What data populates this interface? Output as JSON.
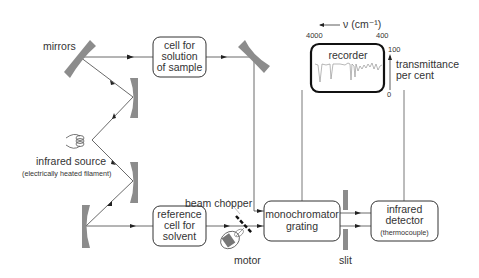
{
  "diagram": {
    "labels": {
      "mirrors": "mirrors",
      "source": "infrared source",
      "source_sub": "(electrically heated filament)",
      "beam_chopper": "beam chopper",
      "motor": "motor",
      "slit": "slit",
      "wavenumber_axis": "ν (cm⁻¹)",
      "wn_left": "4000",
      "wn_right": "400",
      "t_top": "100",
      "t_bottom": "0",
      "transmittance_1": "transmittance",
      "transmittance_2": "per cent"
    },
    "boxes": {
      "sample_cell": [
        "cell for",
        "solution",
        "of sample"
      ],
      "reference_cell": [
        "reference",
        "cell for",
        "solvent"
      ],
      "monochromator": [
        "monochromator",
        "grating"
      ],
      "detector": [
        "infrared",
        "detector",
        "(thermocouple)"
      ],
      "recorder": "recorder"
    },
    "colors": {
      "mirror": "#8c8c8c",
      "line": "#444444",
      "text": "#333333",
      "recorder_border": "#111111"
    }
  }
}
